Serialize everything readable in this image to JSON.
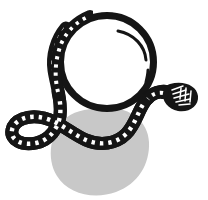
{
  "artwork": {
    "title": "Snake coiled around a ball",
    "subject": "snake-and-sphere-illustration",
    "style": "black-and-white line art with flat grey drop shadow",
    "canvas": {
      "width": 208,
      "height": 200,
      "background_color": "#ffffff"
    },
    "palette": {
      "ink": "#151515",
      "shadow_grey": "#c8c8c8",
      "fill_white": "#ffffff",
      "scale_mark": "#ffffff"
    },
    "elements": [
      {
        "name": "drop-shadow-blob",
        "label": "Grey drop shadow",
        "color": "#c8c8c8",
        "bounds": {
          "x": 52,
          "y": 108,
          "width": 98,
          "height": 87
        }
      },
      {
        "name": "ball",
        "label": "Ball",
        "shape": "circle",
        "center_x": 107,
        "center_y": 62,
        "radius": 50,
        "outline_color": "#151515",
        "outline_width": 7,
        "fill_color": "#ffffff"
      },
      {
        "name": "ball-highlight-arc",
        "label": "Ball highlight arc",
        "color": "#151515",
        "stroke_width": 3
      },
      {
        "name": "ball-highlight-dash",
        "label": "Ball highlight dash",
        "color": "#151515",
        "stroke_width": 3
      },
      {
        "name": "snake-body",
        "label": "Snake body",
        "color": "#151515",
        "band_width": 11,
        "scale_marks": "white dashes along the band"
      },
      {
        "name": "snake-head",
        "label": "Snake head",
        "color": "#151515",
        "position_x": 180,
        "position_y": 97
      }
    ]
  }
}
